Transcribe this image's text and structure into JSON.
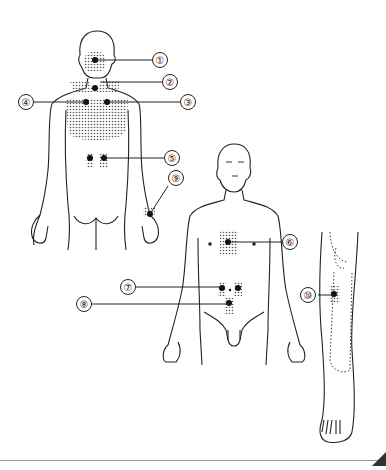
{
  "figure": {
    "views": [
      {
        "id": "back",
        "name": "posterior body view"
      },
      {
        "id": "front",
        "name": "anterior body view"
      },
      {
        "id": "leg",
        "name": "lower leg lateral view"
      }
    ],
    "labels": [
      {
        "num": "1",
        "glyph": "①",
        "view": "back",
        "region": "occiput / upper neck"
      },
      {
        "num": "2",
        "glyph": "②",
        "view": "back",
        "region": "lower neck / C7"
      },
      {
        "num": "3",
        "glyph": "③",
        "view": "back",
        "region": "upper back left of spine"
      },
      {
        "num": "4",
        "glyph": "④",
        "view": "back",
        "region": "upper back right of spine"
      },
      {
        "num": "5",
        "glyph": "⑤",
        "view": "back",
        "region": "lumbar"
      },
      {
        "num": "6",
        "glyph": "⑥",
        "view": "front",
        "region": "sternum / chest"
      },
      {
        "num": "7",
        "glyph": "⑦",
        "view": "front",
        "region": "periumbilical"
      },
      {
        "num": "8",
        "glyph": "⑧",
        "view": "front",
        "region": "lower abdomen"
      },
      {
        "num": "9",
        "glyph": "⑨",
        "view": "back",
        "region": "wrist"
      },
      {
        "num": "10",
        "glyph": "⑩",
        "view": "leg",
        "region": "lateral lower leg below knee"
      }
    ]
  },
  "colors": {
    "line": "#222222",
    "dot": "#111111",
    "shade": "#666666",
    "background": "#ffffff"
  }
}
